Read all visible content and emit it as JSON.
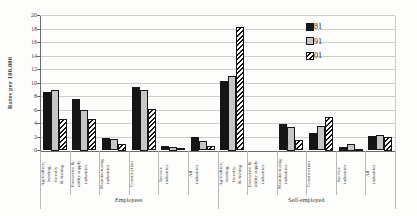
{
  "chart_data": {
    "type": "bar",
    "title": "",
    "ylabel": "Rates per 100,000",
    "ylim": [
      0,
      20
    ],
    "ytick_step": 2,
    "grid": true,
    "legend_position": "inside-upper-right",
    "groups": [
      {
        "label": "Employees",
        "categories": [
          "Agriculture,\nhunting,\nforestry\n& fishing",
          "Extractive &\nutility supply\nindustries",
          "Manufacturing\nindustries",
          "Construction",
          "Service\nindustries",
          "All\nindustries"
        ]
      },
      {
        "label": "Self-employed",
        "categories": [
          "Agriculture,\nhunting,\nforestry\n& fishing",
          "Extractive &\nutility supply\nindustries",
          "Manufacturing\nindustries",
          "Construction",
          "Service\nindustries",
          "All\nindustries"
        ]
      }
    ],
    "series": [
      {
        "name": "1981",
        "fill": "black",
        "values": [
          8.7,
          7.6,
          1.9,
          9.4,
          0.7,
          2.0,
          10.3,
          0,
          3.9,
          2.6,
          0.5,
          2.2
        ]
      },
      {
        "name": "1991",
        "fill": "gray",
        "values": [
          9.0,
          6.0,
          1.7,
          9.0,
          0.5,
          1.4,
          11.0,
          0,
          3.5,
          3.6,
          1.0,
          2.3
        ]
      },
      {
        "name": "2001",
        "fill": "hatch",
        "values": [
          4.7,
          4.7,
          1.0,
          6.1,
          0.3,
          0.7,
          18.3,
          0,
          1.6,
          5.0,
          0.2,
          2.0
        ]
      }
    ],
    "colors": {
      "series_black": "#161616",
      "series_gray": "#c6c6c4",
      "hatch_foreground": "#161616",
      "hatch_background": "#ffffff",
      "gridline": "#cccccb",
      "axis": "#6b6b6b",
      "text": "#3a3a3a"
    }
  }
}
